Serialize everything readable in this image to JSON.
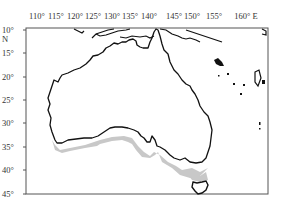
{
  "map": {
    "region": "Australia",
    "longitude_labels": [
      {
        "text": "110°",
        "x": 37
      },
      {
        "text": "115°",
        "x": 56
      },
      {
        "text": "120°",
        "x": 75
      },
      {
        "text": "125°",
        "x": 93
      },
      {
        "text": "130°",
        "x": 112
      },
      {
        "text": "135°",
        "x": 130
      },
      {
        "text": "140°",
        "x": 149
      },
      {
        "text": "145°",
        "x": 174
      },
      {
        "text": "150°",
        "x": 192
      },
      {
        "text": "155°",
        "x": 214
      },
      {
        "text": "160° E",
        "x": 243
      }
    ],
    "latitude_labels": [
      {
        "text": "10°",
        "y": 30
      },
      {
        "text": "N",
        "y": 39
      },
      {
        "text": "15°",
        "y": 53
      },
      {
        "text": "20°",
        "y": 77
      },
      {
        "text": "25°",
        "y": 100
      },
      {
        "text": "30°",
        "y": 123
      },
      {
        "text": "35°",
        "y": 147
      },
      {
        "text": "40°",
        "y": 170
      },
      {
        "text": "45°",
        "y": 194
      }
    ],
    "colors": {
      "coastline": "#111111",
      "shaded_region": "#c8c8c8",
      "frame": "#555555"
    },
    "shaded_area_description": "southern coastal band of mainland Australia and Tasmania"
  }
}
